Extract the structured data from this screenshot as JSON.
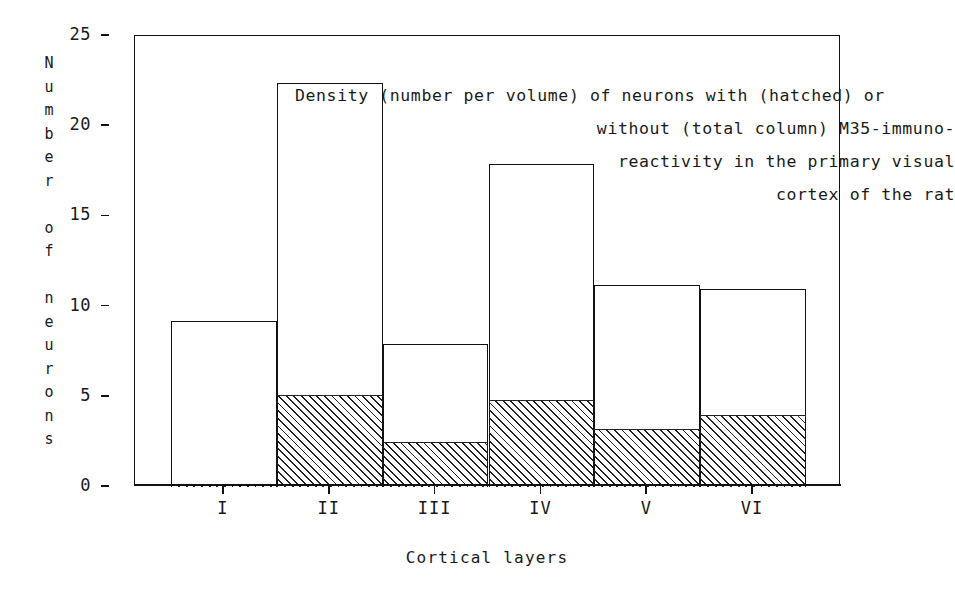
{
  "chart_data": {
    "type": "bar",
    "title_lines": [
      "Density (number per volume) of neurons with (hatched) or",
      "without (total column) M35-immuno-",
      "reactivity in the primary visual",
      "cortex of the rat"
    ],
    "xlabel": "Cortical layers",
    "ylabel": "Number of neurons",
    "ylabel_stacked": "N\nu\nm\nb\ne\nr\n\no\nf\n\nn\ne\nu\nr\no\nn\ns",
    "categories": [
      "I",
      "II",
      "III",
      "IV",
      "V",
      "VI"
    ],
    "ylim": [
      0,
      25
    ],
    "yticks": [
      0,
      5,
      10,
      15,
      20,
      25
    ],
    "ytick_labels": [
      "0",
      "5",
      "10",
      "15",
      "20",
      "25"
    ],
    "grid": false,
    "legend_position": "none",
    "series": [
      {
        "name": "total column (without M35-immunoreactivity shown as outline)",
        "style": "outline",
        "values": [
          9.2,
          22.4,
          7.9,
          17.9,
          11.2,
          11.0
        ]
      },
      {
        "name": "hatched (M35-immunoreactive)",
        "style": "hatched",
        "values": [
          0.1,
          5.1,
          2.5,
          4.8,
          3.2,
          4.0
        ]
      }
    ],
    "colors": {
      "line": "#111111",
      "hatch": "#222222",
      "background": "#ffffff"
    }
  }
}
